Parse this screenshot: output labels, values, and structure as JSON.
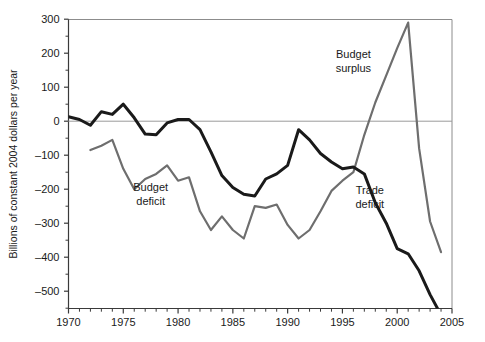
{
  "chart_data": {
    "type": "line",
    "title": "",
    "subtitle": "",
    "xlabel": "",
    "ylabel": "Billions of constant 2004 dollars per year",
    "xlim": [
      1970,
      2005
    ],
    "ylim": [
      -570,
      300
    ],
    "grid": false,
    "zero_line": true,
    "legend_position": "inline-annotations",
    "x_ticks_major": [
      1970,
      1975,
      1980,
      1985,
      1990,
      1995,
      2000,
      2005
    ],
    "x_tick_labels": [
      "1970",
      "1975",
      "1980",
      "1985",
      "1990",
      "1995",
      "2000",
      "2005"
    ],
    "x_ticks_minor_interval": 1,
    "y_ticks_major": [
      300,
      200,
      100,
      0,
      -100,
      -200,
      -300,
      -400,
      -500
    ],
    "y_tick_labels": [
      "300",
      "200",
      "100",
      "0",
      "–100",
      "–200",
      "–300",
      "–400",
      "–500"
    ],
    "y_ticks_minor": [
      250,
      150,
      50,
      -50,
      -150,
      -250,
      -350,
      -450,
      -550
    ],
    "annotations": [
      {
        "text_line1": "Budget",
        "text_line2": "deficit",
        "x": 1977.5,
        "y": -205,
        "name": "budget-deficit-label"
      },
      {
        "text_line1": "Budget",
        "text_line2": "surplus",
        "x": 1996.0,
        "y": 185,
        "name": "budget-surplus-label"
      },
      {
        "text_line1": "Trade",
        "text_line2": "deficit",
        "x": 1997.5,
        "y": -215,
        "name": "trade-deficit-label"
      }
    ],
    "series": [
      {
        "name": "Budget balance (deficit/surplus)",
        "color": "#6e6e6e",
        "width": 2.2,
        "x": [
          1972,
          1973,
          1974,
          1975,
          1976,
          1977,
          1978,
          1979,
          1980,
          1981,
          1982,
          1983,
          1984,
          1985,
          1986,
          1987,
          1988,
          1989,
          1990,
          1991,
          1992,
          1993,
          1994,
          1995,
          1996,
          1997,
          1998,
          1999,
          2000,
          2001,
          2002,
          2003,
          2004
        ],
        "values": [
          -85,
          -72,
          -55,
          -140,
          -200,
          -170,
          -155,
          -130,
          -175,
          -165,
          -265,
          -320,
          -280,
          -320,
          -345,
          -250,
          -255,
          -245,
          -305,
          -345,
          -320,
          -265,
          -205,
          -175,
          -150,
          -40,
          55,
          135,
          215,
          290,
          -80,
          -295,
          -385
        ]
      },
      {
        "name": "Trade balance (deficit)",
        "color": "#1a1a1a",
        "width": 3.0,
        "x": [
          1970,
          1971,
          1972,
          1973,
          1974,
          1975,
          1976,
          1977,
          1978,
          1979,
          1980,
          1981,
          1982,
          1983,
          1984,
          1985,
          1986,
          1987,
          1988,
          1989,
          1990,
          1991,
          1992,
          1993,
          1994,
          1995,
          1996,
          1997,
          1998,
          1999,
          2000,
          2001,
          2002,
          2003,
          2004
        ],
        "values": [
          13,
          5,
          -12,
          28,
          20,
          50,
          10,
          -38,
          -40,
          -5,
          5,
          5,
          -25,
          -90,
          -160,
          -195,
          -215,
          -220,
          -170,
          -155,
          -130,
          -25,
          -55,
          -95,
          -120,
          -140,
          -135,
          -155,
          -240,
          -300,
          -375,
          -390,
          -440,
          -510,
          -570
        ]
      }
    ]
  }
}
